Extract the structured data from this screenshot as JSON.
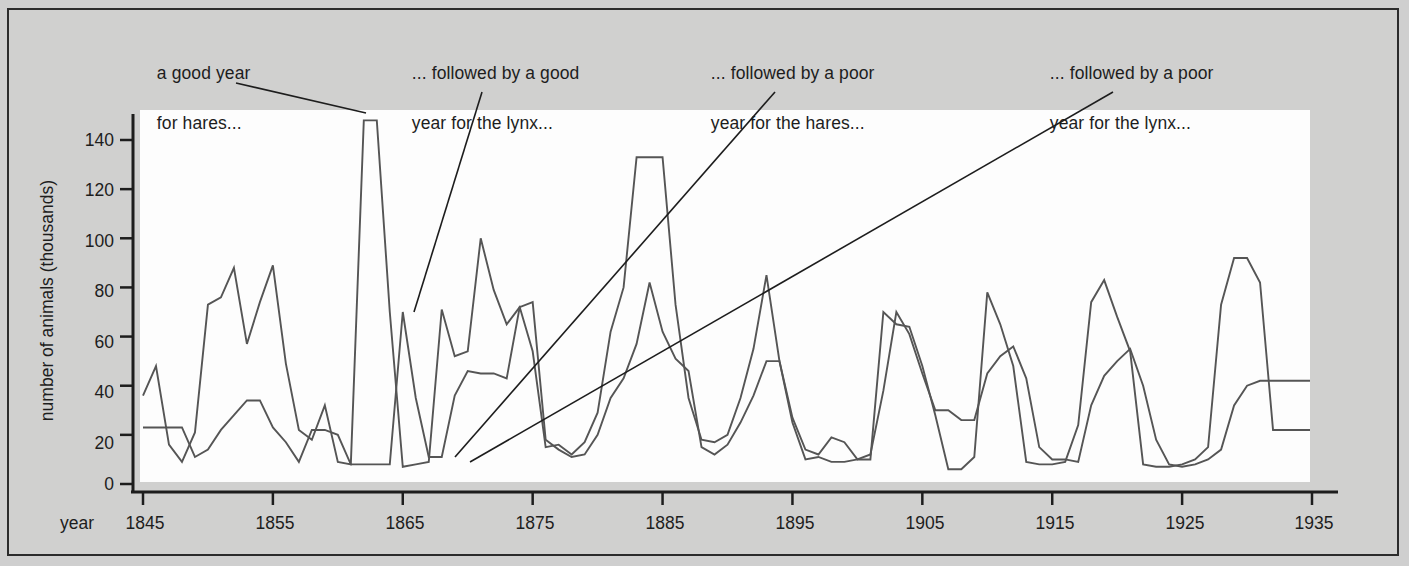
{
  "figure": {
    "background_color": "#cfcfcf",
    "plot_background_color": "#fdfdfd",
    "line_color": "#555555",
    "text_color": "#1d1d1d"
  },
  "annotations": {
    "a1_line1": "a good year",
    "a1_line2": "for hares...",
    "a2_line1": "... followed by a good",
    "a2_line2": "year for the lynx...",
    "a3_line1": "... followed by a poor",
    "a3_line2": "year for the hares...",
    "a4_line1": "... followed by a poor",
    "a4_line2": "year for the lynx..."
  },
  "axes": {
    "y_title": "number of animals (thousands)",
    "x_title": "year",
    "y_ticks": [
      "0",
      "20",
      "40",
      "60",
      "80",
      "100",
      "120",
      "140"
    ],
    "x_ticks": [
      "1845",
      "1855",
      "1865",
      "1875",
      "1885",
      "1895",
      "1905",
      "1915",
      "1925",
      "1935"
    ]
  },
  "chart_data": {
    "type": "line",
    "title": "",
    "xlabel": "year",
    "ylabel": "number of animals (thousands)",
    "xlim": [
      1845,
      1935
    ],
    "ylim": [
      0,
      150
    ],
    "ytick_values": [
      0,
      20,
      40,
      60,
      80,
      100,
      120,
      140
    ],
    "xtick_values": [
      1845,
      1855,
      1865,
      1875,
      1885,
      1895,
      1905,
      1915,
      1925,
      1935
    ],
    "grid": false,
    "legend": "none",
    "x": [
      1845,
      1846,
      1847,
      1848,
      1849,
      1850,
      1851,
      1852,
      1853,
      1854,
      1855,
      1856,
      1857,
      1858,
      1859,
      1860,
      1861,
      1862,
      1863,
      1864,
      1865,
      1866,
      1867,
      1868,
      1869,
      1870,
      1871,
      1872,
      1873,
      1874,
      1875,
      1876,
      1877,
      1878,
      1879,
      1880,
      1881,
      1882,
      1883,
      1884,
      1885,
      1886,
      1887,
      1888,
      1889,
      1890,
      1891,
      1892,
      1893,
      1894,
      1895,
      1896,
      1897,
      1898,
      1899,
      1900,
      1901,
      1902,
      1903,
      1904,
      1905,
      1906,
      1907,
      1908,
      1909,
      1910,
      1911,
      1912,
      1913,
      1914,
      1915,
      1916,
      1917,
      1918,
      1919,
      1920,
      1921,
      1922,
      1923,
      1924,
      1925,
      1926,
      1927,
      1928,
      1929,
      1930,
      1931,
      1932,
      1933,
      1934,
      1935
    ],
    "series": [
      {
        "name": "hare",
        "values": [
          36,
          48,
          16,
          9,
          21,
          73,
          76,
          88,
          57,
          74,
          89,
          49,
          22,
          18,
          32,
          9,
          8,
          148,
          148,
          70,
          7,
          8,
          9,
          71,
          52,
          54,
          100,
          79,
          65,
          72,
          54,
          15,
          16,
          12,
          17,
          29,
          62,
          80,
          133,
          133,
          133,
          73,
          35,
          18,
          17,
          20,
          35,
          55,
          85,
          50,
          25,
          10,
          11,
          9,
          9,
          10,
          10,
          70,
          65,
          64,
          48,
          28,
          6,
          6,
          11,
          78,
          65,
          48,
          9,
          8,
          8,
          9,
          24,
          74,
          83,
          68,
          54,
          8,
          7,
          7,
          8,
          10,
          15,
          73,
          92,
          92,
          82,
          22,
          22,
          22,
          22
        ]
      },
      {
        "name": "lynx",
        "values": [
          23,
          23,
          23,
          23,
          11,
          14,
          22,
          28,
          34,
          34,
          23,
          17,
          9,
          22,
          22,
          20,
          8,
          8,
          8,
          8,
          70,
          35,
          11,
          11,
          36,
          46,
          45,
          45,
          43,
          72,
          74,
          18,
          14,
          11,
          12,
          20,
          35,
          43,
          57,
          82,
          62,
          51,
          46,
          15,
          12,
          16,
          25,
          36,
          50,
          50,
          27,
          14,
          12,
          19,
          17,
          10,
          12,
          38,
          70,
          61,
          45,
          30,
          30,
          26,
          26,
          45,
          52,
          56,
          43,
          15,
          10,
          10,
          9,
          32,
          44,
          50,
          55,
          40,
          18,
          8,
          7,
          8,
          10,
          14,
          32,
          40,
          42,
          42,
          42,
          42,
          42
        ]
      }
    ]
  }
}
